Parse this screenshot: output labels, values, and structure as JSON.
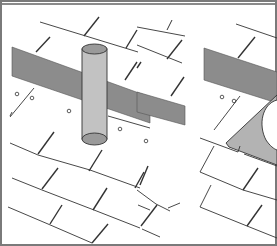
{
  "figure": {
    "panels": [
      {
        "id": "left",
        "subject": "vent pipe through shingles"
      },
      {
        "id": "right",
        "subject": "flashing plate over shingles"
      }
    ],
    "colors": {
      "frame": "#7a7a7a",
      "underlayment": "#8c8c8c",
      "pipe": "#c2c2c2",
      "pipe_top": "#9a9a9a",
      "flashing": "#b3b3b3",
      "line": "#333333",
      "background": "#ffffff"
    }
  }
}
